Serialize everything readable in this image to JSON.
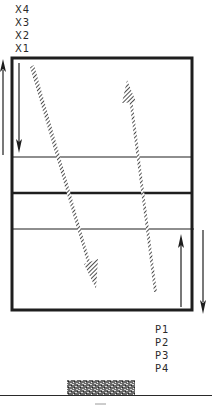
{
  "diagram": {
    "x_labels": [
      "X4",
      "X3",
      "X2",
      "X1"
    ],
    "p_labels": [
      "P1",
      "P2",
      "P3",
      "P4"
    ],
    "colors": {
      "stroke": "#1e1e1e",
      "hatch": "#3a3a3a",
      "background": "#ffffff",
      "base_block": "#555555"
    },
    "box": {
      "x": 12,
      "y": 58,
      "width": 180,
      "height": 252
    },
    "dividers": [
      {
        "y": 157,
        "weight": "thin"
      },
      {
        "y": 193,
        "weight": "thick"
      },
      {
        "y": 229,
        "weight": "thin"
      }
    ],
    "arrows": [
      {
        "name": "outer-left-up",
        "direction": "up",
        "x": 3,
        "y_start": 155,
        "y_end": 60
      },
      {
        "name": "inner-left-down",
        "direction": "down",
        "x": 19,
        "y_start": 63,
        "y_end": 152
      },
      {
        "name": "inner-right-up",
        "direction": "up",
        "x": 181,
        "y_start": 307,
        "y_end": 235
      },
      {
        "name": "outer-right-down",
        "direction": "down",
        "x": 203,
        "y_start": 230,
        "y_end": 313
      }
    ],
    "hatched_arrows": [
      {
        "name": "hatched-down-diagonal",
        "from": [
          32,
          66
        ],
        "to": [
          96,
          288
        ]
      },
      {
        "name": "hatched-up-diagonal",
        "from": [
          155,
          292
        ],
        "to": [
          127,
          80
        ]
      }
    ],
    "base": {
      "block": {
        "x": 67,
        "y": 380,
        "width": 68,
        "height": 15
      },
      "ground_line_y": 395
    }
  }
}
